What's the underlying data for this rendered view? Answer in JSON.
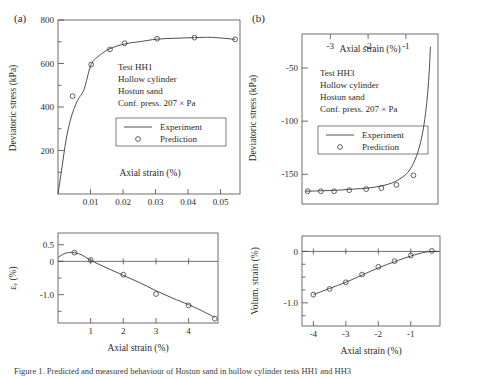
{
  "figure": {
    "panel_a_label": "(a)",
    "panel_b_label": "(b)",
    "caption": "Figure 1.  Predicted and measured behaviour of Hostun sand in hollow cylinder tests HH1 and HH3"
  },
  "annotations": {
    "a": {
      "line1": "Test HH1",
      "line2": "Hollow cylinder",
      "line3": "Hostun sand",
      "line4": "Conf.  press. 207 × Pa"
    },
    "b": {
      "line1": "Test HH3",
      "line2": "Hollow cylinder",
      "line3": "Hostun sand",
      "line4": "Conf.  press. 207 × Pa"
    }
  },
  "legend": {
    "experiment": "Experiment",
    "prediction": "Prediction",
    "line_color": "#3a3a3a",
    "marker_color": "#3a3a3a"
  },
  "axis_titles": {
    "axial_strain": "Axial strain (%)",
    "deviatoric_stress": "Deviatoric stress (kPa)",
    "volumetric_strain_a": "εᵥ (%)",
    "volumetric_strain_b": "Volum. strain (%)"
  },
  "chart_data": [
    {
      "id": "a-top",
      "type": "line",
      "title": "",
      "xlabel": "Axial strain (%)",
      "ylabel": "Deviatoric stress (kPa)",
      "xlim": [
        0,
        0.056
      ],
      "ylim": [
        0,
        800
      ],
      "xticks": [
        0.01,
        0.02,
        0.03,
        0.04,
        0.05
      ],
      "xtick_labels": [
        "0.01",
        "0.02",
        "0.03",
        "0.04",
        "0.05"
      ],
      "yticks": [
        200,
        400,
        600,
        800
      ],
      "ytick_labels": [
        "200",
        "400",
        "600",
        "800"
      ],
      "yminor": [
        100,
        300,
        500,
        700
      ],
      "grid": false,
      "legend_position": "center",
      "xaxis_position": "bottom",
      "series": [
        {
          "name": "Experiment",
          "style": "line",
          "x": [
            0.0,
            0.0012,
            0.0025,
            0.004,
            0.006,
            0.008,
            0.0102,
            0.013,
            0.016,
            0.0205,
            0.025,
            0.0305,
            0.036,
            0.042,
            0.0475,
            0.0545
          ],
          "y": [
            0,
            120,
            250,
            350,
            430,
            480,
            595,
            640,
            668,
            690,
            700,
            712,
            716,
            719,
            720,
            711
          ]
        },
        {
          "name": "Prediction",
          "style": "marker",
          "x": [
            0.0045,
            0.0102,
            0.016,
            0.0205,
            0.0305,
            0.042,
            0.0545
          ],
          "y": [
            450,
            595,
            665,
            693,
            714,
            719,
            711
          ]
        }
      ]
    },
    {
      "id": "a-bottom",
      "type": "line",
      "xlabel": "Axial strain (%)",
      "ylabel": "εᵥ (%)",
      "xlim": [
        0,
        4.9
      ],
      "ylim": [
        -1.85,
        0.85
      ],
      "xticks": [
        1,
        2,
        3,
        4
      ],
      "xtick_labels": [
        "1",
        "2",
        "3",
        "4"
      ],
      "yticks": [
        0.5,
        0,
        -1.0
      ],
      "ytick_labels": [
        "0.5",
        "0",
        "-1.0"
      ],
      "yminor": [
        -0.5,
        -1.5
      ],
      "zero_line": 0,
      "grid": false,
      "series": [
        {
          "name": "Experiment",
          "style": "line",
          "x": [
            0.0,
            0.25,
            0.5,
            0.75,
            1.0,
            1.5,
            2.0,
            2.5,
            3.0,
            3.5,
            4.0,
            4.4,
            4.8
          ],
          "y": [
            0.12,
            0.25,
            0.26,
            0.18,
            0.03,
            -0.2,
            -0.42,
            -0.64,
            -0.88,
            -1.1,
            -1.3,
            -1.48,
            -1.68
          ]
        },
        {
          "name": "Prediction",
          "style": "marker",
          "x": [
            0.5,
            1.0,
            2.0,
            3.0,
            4.0,
            4.8
          ],
          "y": [
            0.26,
            0.04,
            -0.4,
            -0.98,
            -1.32,
            -1.72
          ]
        }
      ]
    },
    {
      "id": "b-top",
      "type": "line",
      "xlabel": "Axial strain (%)",
      "ylabel": "Deviatoric stress (kPa)",
      "xlim": [
        -3.75,
        -0.15
      ],
      "ylim": [
        -178,
        -18
      ],
      "xticks": [
        -3,
        -2,
        -1
      ],
      "xtick_labels": [
        "-3",
        "-2",
        "-1"
      ],
      "yticks": [
        -50,
        -100,
        -150
      ],
      "ytick_labels": [
        "-50",
        "-100",
        "-150"
      ],
      "grid": false,
      "legend_position": "center",
      "xaxis_position": "top",
      "series": [
        {
          "name": "Experiment",
          "style": "line",
          "x": [
            -3.65,
            -3.2,
            -2.8,
            -2.4,
            -2.0,
            -1.65,
            -1.35,
            -1.1,
            -0.9,
            -0.72,
            -0.58,
            -0.48,
            -0.42,
            -0.38,
            -0.35
          ],
          "y": [
            -166,
            -165.5,
            -165,
            -164,
            -163,
            -161,
            -158,
            -153,
            -146,
            -133,
            -115,
            -93,
            -72,
            -52,
            -30
          ]
        },
        {
          "name": "Prediction",
          "style": "marker",
          "x": [
            -3.6,
            -3.25,
            -2.9,
            -2.5,
            -2.05,
            -1.65,
            -1.25,
            -0.8
          ],
          "y": [
            -166,
            -166,
            -166,
            -165,
            -164,
            -163,
            -160,
            -151
          ]
        }
      ]
    },
    {
      "id": "b-bottom",
      "type": "line",
      "xlabel": "Axial strain (%)",
      "ylabel": "Volum. strain (%)",
      "xlim": [
        -4.35,
        -0.1
      ],
      "ylim": [
        -1.45,
        0.3
      ],
      "xticks": [
        -4,
        -3,
        -2,
        -1
      ],
      "xtick_labels": [
        "-4",
        "-3",
        "-2",
        "-1"
      ],
      "yticks": [
        0,
        -1.0
      ],
      "ytick_labels": [
        "0",
        "-1.0"
      ],
      "yminor": [
        -0.25,
        -0.5,
        -0.75,
        -1.25
      ],
      "zero_line": 0,
      "grid": false,
      "series": [
        {
          "name": "Experiment",
          "style": "line",
          "x": [
            -4.0,
            -3.5,
            -3.0,
            -2.5,
            -2.0,
            -1.5,
            -1.0,
            -0.6,
            -0.35,
            -0.15
          ],
          "y": [
            -0.84,
            -0.72,
            -0.6,
            -0.46,
            -0.32,
            -0.2,
            -0.09,
            -0.02,
            0.0,
            0.0
          ]
        },
        {
          "name": "Prediction",
          "style": "marker",
          "x": [
            -4.0,
            -3.5,
            -3.0,
            -2.5,
            -2.0,
            -1.5,
            -1.0,
            -0.35
          ],
          "y": [
            -0.84,
            -0.73,
            -0.6,
            -0.45,
            -0.3,
            -0.19,
            -0.08,
            0.01
          ]
        }
      ]
    }
  ]
}
